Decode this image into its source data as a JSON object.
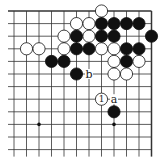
{
  "board": {
    "cols": 12,
    "rows": 12,
    "origin_x": 14,
    "origin_y": 11,
    "step_x": 12.5,
    "step_y": 12.6,
    "line_color": "#333333",
    "edges": {
      "top": true,
      "right": true,
      "left": false,
      "bottom": false
    },
    "star_points": [
      [
        3,
        10
      ],
      [
        9,
        10
      ]
    ]
  },
  "stones": [
    {
      "color": "white",
      "col": 8,
      "row": 1
    },
    {
      "color": "white",
      "col": 6,
      "row": 2
    },
    {
      "color": "white",
      "col": 7,
      "row": 2
    },
    {
      "color": "black",
      "col": 8,
      "row": 2
    },
    {
      "color": "black",
      "col": 9,
      "row": 2
    },
    {
      "color": "black",
      "col": 10,
      "row": 2
    },
    {
      "color": "black",
      "col": 11,
      "row": 2
    },
    {
      "color": "white",
      "col": 5,
      "row": 3
    },
    {
      "color": "black",
      "col": 6,
      "row": 3
    },
    {
      "color": "white",
      "col": 7,
      "row": 3
    },
    {
      "color": "black",
      "col": 8,
      "row": 3
    },
    {
      "color": "black",
      "col": 9,
      "row": 3
    },
    {
      "color": "black",
      "col": 12,
      "row": 3
    },
    {
      "color": "white",
      "col": 2,
      "row": 4
    },
    {
      "color": "white",
      "col": 3,
      "row": 4
    },
    {
      "color": "white",
      "col": 5,
      "row": 4
    },
    {
      "color": "black",
      "col": 6,
      "row": 4
    },
    {
      "color": "black",
      "col": 7,
      "row": 4
    },
    {
      "color": "white",
      "col": 8,
      "row": 4
    },
    {
      "color": "white",
      "col": 9,
      "row": 4
    },
    {
      "color": "black",
      "col": 10,
      "row": 4
    },
    {
      "color": "black",
      "col": 11,
      "row": 4
    },
    {
      "color": "black",
      "col": 4,
      "row": 5
    },
    {
      "color": "black",
      "col": 5,
      "row": 5
    },
    {
      "color": "white",
      "col": 9,
      "row": 5
    },
    {
      "color": "black",
      "col": 10,
      "row": 5
    },
    {
      "color": "white",
      "col": 11,
      "row": 5
    },
    {
      "color": "black",
      "col": 6,
      "row": 6
    },
    {
      "color": "white",
      "col": 9,
      "row": 6
    },
    {
      "color": "white",
      "col": 10,
      "row": 6
    },
    {
      "color": "white",
      "col": 8,
      "row": 8,
      "label": "1"
    },
    {
      "color": "black",
      "col": 9,
      "row": 9
    }
  ],
  "markers": [
    {
      "text": "b",
      "col": 7,
      "row": 6
    },
    {
      "text": "a",
      "col": 9,
      "row": 8
    }
  ]
}
